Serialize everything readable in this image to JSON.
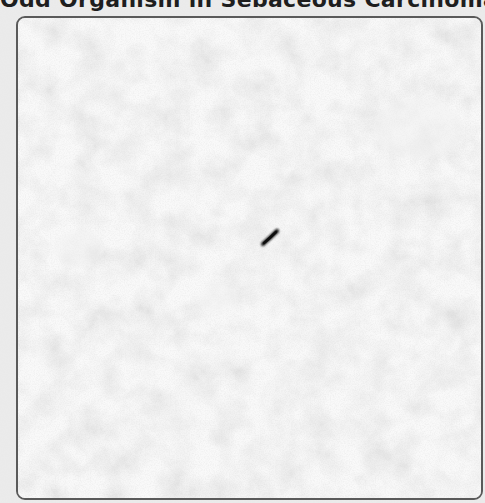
{
  "figure": {
    "title": "Odd Organism in Sebaceous Carcinoma",
    "image": {
      "subject": "micrograph",
      "description": "Grayscale mottled tissue background with a single dark rod-shaped organism near the center",
      "tones": {
        "background_light": "#ececec",
        "background_dark": "#9c9c9c",
        "organism": "#1a1a1a",
        "frame_border": "#5a5a5a",
        "title_text": "#1e1e1e",
        "page": "#e8e8e8"
      }
    }
  }
}
